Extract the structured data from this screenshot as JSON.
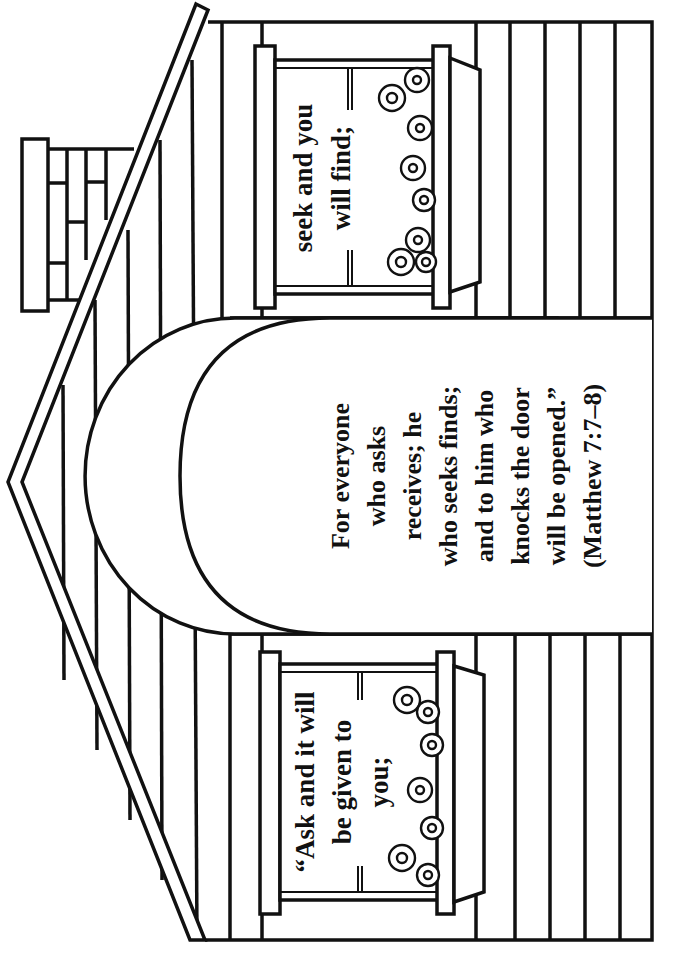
{
  "page": {
    "type": "coloring-page",
    "orientation": "rotated 90° clockwise"
  },
  "window_left": {
    "lines": [
      "“Ask and it will",
      "be given to",
      "you;"
    ]
  },
  "window_right": {
    "lines": [
      "seek and you",
      "will find;"
    ]
  },
  "door": {
    "lines": [
      "For everyone",
      "who asks",
      "receives; he",
      "who seeks finds;",
      "and to him who",
      "knocks the door",
      "will be opened.”",
      "(Matthew 7:7–8)"
    ]
  },
  "colors": {
    "line": "#111111",
    "background": "#ffffff"
  }
}
